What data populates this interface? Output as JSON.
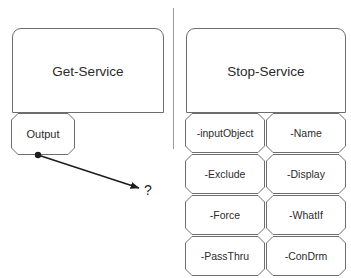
{
  "diagram": {
    "title_left": "Get-Service",
    "title_right": "Stop-Service",
    "output_label": "Output",
    "unknown_marker": "?",
    "colors": {
      "stroke": "#6d6d6d",
      "text": "#2b2b2b",
      "connector": "#1d1d1d",
      "divider": "#9a9a9a",
      "background": "#ffffff"
    },
    "left_panel": {
      "cmdlet": "Get-Service",
      "output_port": "Output"
    },
    "right_panel": {
      "cmdlet": "Stop-Service",
      "parameters": [
        {
          "label": "-inputObject"
        },
        {
          "label": "-Name"
        },
        {
          "label": "-Exclude"
        },
        {
          "label": "-Display"
        },
        {
          "label": "-Force"
        },
        {
          "label": "-WhatIf"
        },
        {
          "label": "-PassThru"
        },
        {
          "label": "-ConDrm"
        }
      ]
    }
  }
}
